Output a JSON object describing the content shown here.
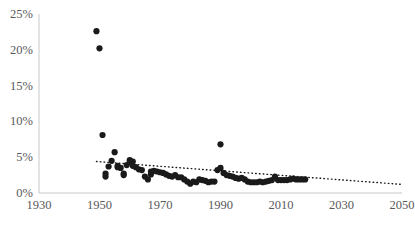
{
  "chart_data": {
    "type": "scatter",
    "title": "",
    "subtitle": "",
    "xlabel": "",
    "ylabel": "",
    "xlim": [
      1930,
      2050
    ],
    "ylim": [
      0,
      25
    ],
    "grid": false,
    "legend": null,
    "y_tick_labels": [
      "0%",
      "5%",
      "10%",
      "15%",
      "20%",
      "25%"
    ],
    "y_tick_values": [
      0,
      5,
      10,
      15,
      20,
      25
    ],
    "x_tick_labels": [
      "1930",
      "1950",
      "1970",
      "1990",
      "2010",
      "2030",
      "2050"
    ],
    "x_tick_values": [
      1930,
      1950,
      1970,
      1990,
      2010,
      2030,
      2050
    ],
    "y_unit": "%",
    "marker": "filled-circle",
    "marker_color": "#1a1a1a",
    "axis_color": "#bfbfbf",
    "tick_label_color": "#59595b",
    "series": [
      {
        "name": "observations",
        "x": [
          1949,
          1950,
          1951,
          1952,
          1952,
          1953,
          1954,
          1955,
          1956,
          1956,
          1957,
          1958,
          1958,
          1959,
          1960,
          1960,
          1961,
          1961,
          1962,
          1963,
          1964,
          1965,
          1966,
          1967,
          1967,
          1968,
          1969,
          1970,
          1971,
          1972,
          1973,
          1974,
          1975,
          1976,
          1977,
          1978,
          1979,
          1980,
          1981,
          1982,
          1983,
          1984,
          1985,
          1986,
          1987,
          1988,
          1989,
          1990,
          1990,
          1991,
          1992,
          1993,
          1994,
          1995,
          1996,
          1997,
          1998,
          1999,
          2000,
          2001,
          2002,
          2003,
          2004,
          2005,
          2006,
          2007,
          2008,
          2009,
          2010,
          2011,
          2012,
          2013,
          2014,
          2015,
          2016,
          2017,
          2018
        ],
        "y": [
          22.6,
          20.2,
          8.1,
          2.7,
          2.3,
          3.7,
          4.5,
          5.7,
          3.8,
          3.6,
          3.5,
          2.5,
          2.7,
          3.9,
          4.6,
          4.3,
          4.4,
          3.8,
          3.6,
          3.3,
          3.2,
          2.3,
          1.9,
          2.6,
          3.0,
          3.1,
          3.0,
          2.9,
          2.8,
          2.6,
          2.4,
          2.3,
          2.5,
          2.2,
          2.2,
          1.9,
          1.6,
          1.3,
          1.6,
          1.5,
          1.9,
          1.8,
          1.7,
          1.5,
          1.6,
          1.6,
          3.2,
          6.8,
          3.5,
          2.8,
          2.5,
          2.4,
          2.3,
          2.1,
          2.0,
          2.1,
          1.9,
          1.6,
          1.5,
          1.5,
          1.5,
          1.6,
          1.5,
          1.6,
          1.7,
          1.8,
          2.3,
          1.8,
          1.8,
          1.8,
          1.8,
          1.9,
          2.0,
          1.9,
          1.9,
          1.9,
          1.9
        ]
      }
    ],
    "trendline": {
      "name": "linear-trend",
      "style": "dotted",
      "color": "#1a1a1a",
      "x_start": 1949,
      "y_start": 4.4,
      "x_end": 2050,
      "y_end": 1.2
    }
  }
}
